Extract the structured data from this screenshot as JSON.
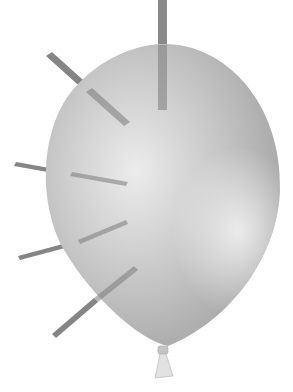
{
  "image": {
    "subject": "Balloon pierced by five skewers",
    "background_color": "#ffffff",
    "balloon": {
      "color_light": "#e4e4e4",
      "color_mid": "#b9b9b9",
      "color_dark": "#8f8f8f",
      "highlight_color": "#f2f2f2"
    },
    "skewer": {
      "color": "#8a8a8a",
      "edge_color": "#6e6e6e",
      "count": 5
    },
    "knot_color": "#d0d0d0"
  }
}
